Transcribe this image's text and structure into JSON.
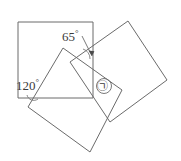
{
  "figure": {
    "background_color": "#ffffff",
    "stroke_color": "#6b6b6b",
    "text_color": "#3b3b3b",
    "labels": {
      "angle_65": "65",
      "angle_65_full": "65°",
      "angle_120": "120",
      "angle_120_full": "120°",
      "degree_symbol": "°",
      "unknown_angle": "㉠"
    },
    "shapes": [
      {
        "name": "axis-aligned-square",
        "points": "18,22 93,22 93,98 18,98"
      },
      {
        "name": "left-tilted-square",
        "points": "63,48 122,90 90,152 28,107"
      },
      {
        "name": "right-tilted-square",
        "points": "128,21 167,80 110,122 70,62"
      }
    ],
    "angle_marks": [
      {
        "name": "arc-65",
        "d": "M 83 49 A 10 10 0 0 1 90 59"
      },
      {
        "name": "arc-120",
        "d": "M 27 95 A 7 7 0 0 0 38 99"
      }
    ],
    "leader": {
      "name": "leader-65",
      "d": "M 82 36 L 92 56",
      "arrow": "92,56 88.6,50.6 94.4,51.2"
    }
  }
}
